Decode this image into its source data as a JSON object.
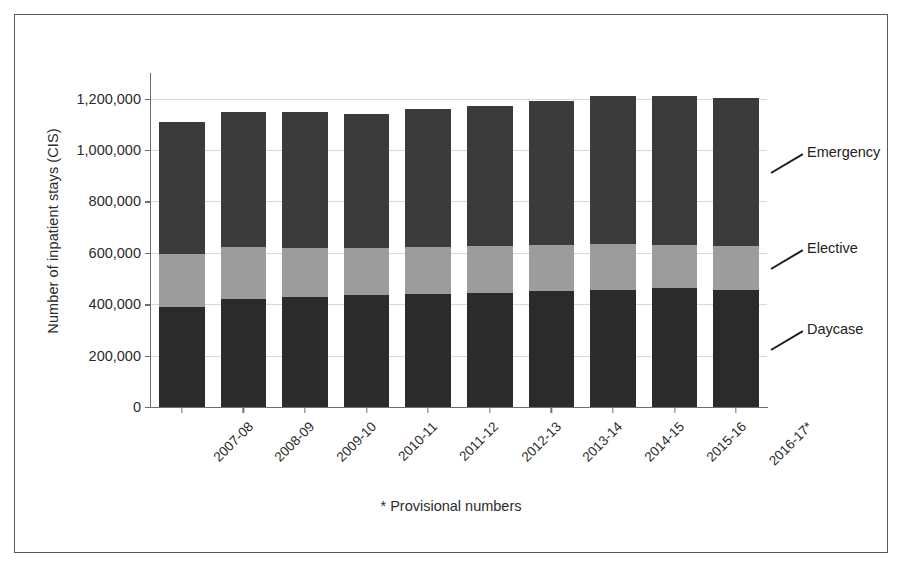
{
  "chart_data": {
    "type": "bar",
    "subtype": "stacked-bar",
    "title": "",
    "xlabel": "",
    "ylabel": "Number of inpatient stays (CIS)",
    "ylim": [
      0,
      1300000
    ],
    "yticks": [
      0,
      200000,
      400000,
      600000,
      800000,
      1000000,
      1200000
    ],
    "ytick_labels": [
      "0",
      "200,000",
      "400,000",
      "600,000",
      "800,000",
      "1,000,000",
      "1,200,000"
    ],
    "grid": true,
    "grid_axis": "y",
    "legend_position": "right-annotations",
    "categories": [
      "2007-08",
      "2008-09",
      "2009-10",
      "2010-11",
      "2011-12",
      "2012-13",
      "2013-14",
      "2014-15",
      "2015-16",
      "2016-17*"
    ],
    "series": [
      {
        "name": "Daycase",
        "color": "#2b2b2b",
        "values": [
          390000,
          420000,
          430000,
          435000,
          440000,
          445000,
          450000,
          455000,
          462000,
          455000
        ]
      },
      {
        "name": "Elective",
        "color": "#9c9c9c",
        "values": [
          205000,
          202000,
          190000,
          185000,
          182000,
          180000,
          180000,
          180000,
          170000,
          170000
        ]
      },
      {
        "name": "Emergency",
        "color": "#3b3b3b",
        "values": [
          515000,
          528000,
          530000,
          522000,
          538000,
          545000,
          560000,
          575000,
          580000,
          578000
        ]
      }
    ],
    "totals": [
      1110000,
      1150000,
      1150000,
      1142000,
      1160000,
      1170000,
      1190000,
      1210000,
      1212000,
      1203000
    ],
    "annotations": [
      {
        "label": "Emergency",
        "series": "Emergency"
      },
      {
        "label": "Elective",
        "series": "Elective"
      },
      {
        "label": "Daycase",
        "series": "Daycase"
      }
    ],
    "footnote": "* Provisional numbers"
  },
  "colors": {
    "daycase": "#2b2b2b",
    "elective": "#9c9c9c",
    "emergency": "#3b3b3b",
    "axis": "#6e6e6e",
    "grid": "#d8d8d8",
    "frame": "#5a5a5a",
    "text": "#2b2b2b"
  }
}
